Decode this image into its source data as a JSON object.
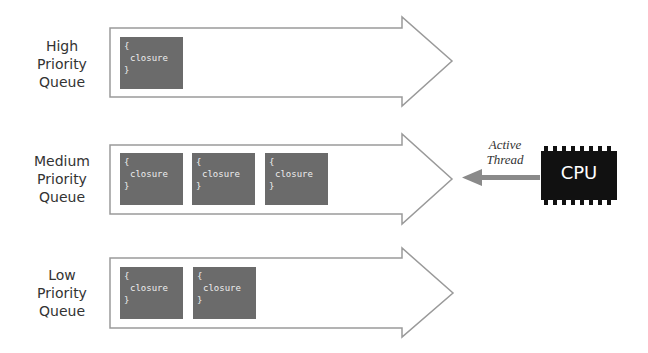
{
  "queues": [
    {
      "label_lines": [
        "High",
        "Priority",
        "Queue"
      ],
      "closures": [
        {
          "open": "{",
          "text": "closure",
          "close": "}"
        }
      ]
    },
    {
      "label_lines": [
        "Medium",
        "Priority",
        "Queue"
      ],
      "closures": [
        {
          "open": "{",
          "text": "closure",
          "close": "}"
        },
        {
          "open": "{",
          "text": "closure",
          "close": "}"
        },
        {
          "open": "{",
          "text": "closure",
          "close": "}"
        }
      ]
    },
    {
      "label_lines": [
        "Low",
        "Priority",
        "Queue"
      ],
      "closures": [
        {
          "open": "{",
          "text": "closure",
          "close": "}"
        },
        {
          "open": "{",
          "text": "closure",
          "close": "}"
        }
      ]
    }
  ],
  "active_thread": {
    "line1": "Active",
    "line2": "Thread"
  },
  "cpu": {
    "label": "CPU"
  },
  "colors": {
    "closure_fill": "#6b6b6b",
    "arrow_outline": "#9a9a9a",
    "cpu_fill": "#111111",
    "thread_arrow": "#8a8a8a"
  }
}
